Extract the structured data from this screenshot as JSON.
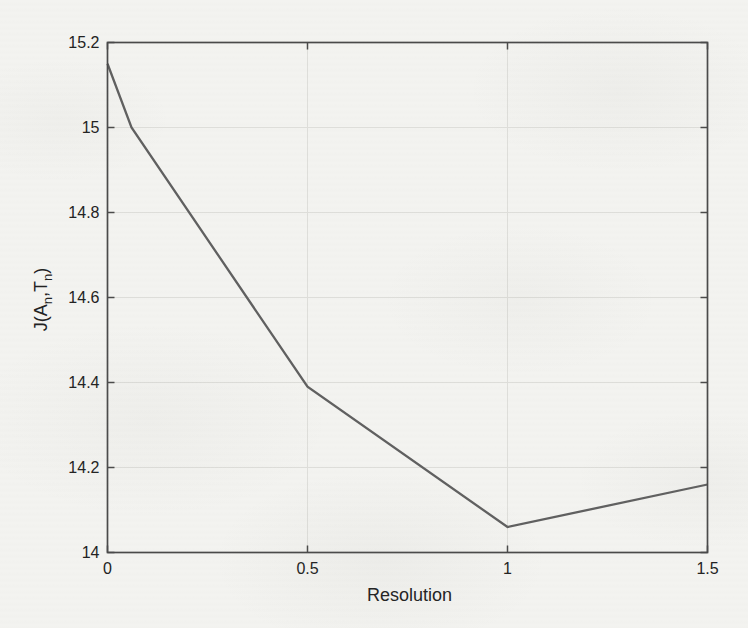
{
  "figure": {
    "kind": "scanned-matlab-plot",
    "background_color": "#f3f3f0"
  },
  "chart_data": {
    "type": "line",
    "title": "",
    "xlabel": "Resolution",
    "ylabel": "J(A_n,T_n)",
    "x": [
      0,
      0.06,
      0.5,
      1,
      1.5
    ],
    "y": [
      15.15,
      15.0,
      14.39,
      14.06,
      14.16
    ],
    "xlim": [
      0,
      1.5
    ],
    "ylim": [
      14,
      15.2
    ],
    "xtick_values": [
      0,
      0.5,
      1,
      1.5
    ],
    "xtick_labels": [
      "0",
      "0.5",
      "1",
      "1.5"
    ],
    "ytick_values": [
      14,
      14.2,
      14.4,
      14.6,
      14.8,
      15,
      15.2
    ],
    "ytick_labels": [
      "14",
      "14.2",
      "14.4",
      "14.6",
      "14.8",
      "15",
      "15.2"
    ],
    "grid": true,
    "legend": null,
    "colors": {
      "line": "#606060",
      "axis": "#4a4a4a",
      "grid": "#dededa",
      "text": "#222222"
    }
  }
}
